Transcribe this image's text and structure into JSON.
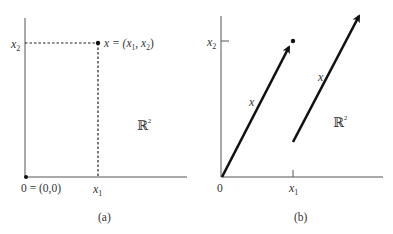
{
  "panel_a": {
    "caption": "(a)",
    "y_tick_label": "x",
    "y_tick_sub": "2",
    "x_tick_label": "x",
    "x_tick_sub": "1",
    "origin_label": "0 = (0,0)",
    "point_label_prefix": "x = (x",
    "point_label_sub1": "1",
    "point_label_mid": ", x",
    "point_label_sub2": "2",
    "point_label_suffix": ")",
    "space_label": "ℝ",
    "space_sup": "2"
  },
  "panel_b": {
    "caption": "(b)",
    "y_tick_label": "x",
    "y_tick_sub": "2",
    "x_tick_label": "x",
    "x_tick_sub": "1",
    "origin_label": "0",
    "vector1_label": "x",
    "vector2_label": "x",
    "space_label": "ℝ",
    "space_sup": "2"
  }
}
